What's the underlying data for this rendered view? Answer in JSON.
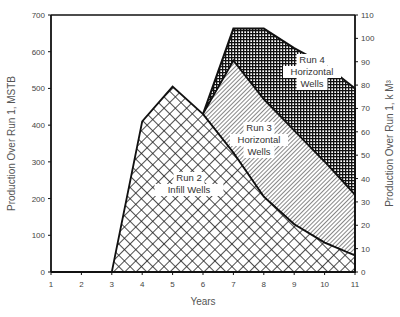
{
  "chart_data": {
    "type": "area",
    "title": "",
    "xlabel": "Years",
    "ylabel": "Production Over Run 1, MSTB",
    "ylabel_right": "Production Over Run 1, k M³",
    "x": [
      1,
      2,
      3,
      4,
      5,
      6,
      7,
      8,
      9,
      10,
      11
    ],
    "xlim": [
      1,
      11
    ],
    "ylim": [
      0,
      700
    ],
    "ylim_right": [
      0,
      110
    ],
    "x_ticks": [
      "1",
      "2",
      "3",
      "4",
      "5",
      "6",
      "7",
      "8",
      "9",
      "10",
      "11"
    ],
    "y_ticks": [
      "0",
      "100",
      "200",
      "300",
      "400",
      "500",
      "600",
      "700"
    ],
    "y_ticks_right": [
      "0",
      "10",
      "20",
      "30",
      "40",
      "50",
      "60",
      "70",
      "80",
      "90",
      "100",
      "110"
    ],
    "grid": false,
    "series": [
      {
        "name": "Run 2 Infill Wells",
        "pattern": "crosshatch",
        "values": [
          0,
          0,
          0,
          410,
          505,
          430,
          325,
          205,
          130,
          80,
          45
        ]
      },
      {
        "name": "Run 3 Horizontal Wells",
        "pattern": "diagonal",
        "values": [
          null,
          null,
          null,
          null,
          null,
          430,
          575,
          470,
          385,
          300,
          210
        ]
      },
      {
        "name": "Run 4 Horizontal Wells",
        "pattern": "dense-grid",
        "values": [
          null,
          null,
          null,
          null,
          null,
          430,
          663,
          663,
          610,
          565,
          500
        ]
      }
    ],
    "annotations": [
      {
        "text": [
          "Run 2",
          "Infill Wells"
        ]
      },
      {
        "text": [
          "Run 3",
          "Horizontal",
          "Wells"
        ]
      },
      {
        "text": [
          "Run 4",
          "Horizontal",
          "Wells"
        ]
      }
    ]
  }
}
